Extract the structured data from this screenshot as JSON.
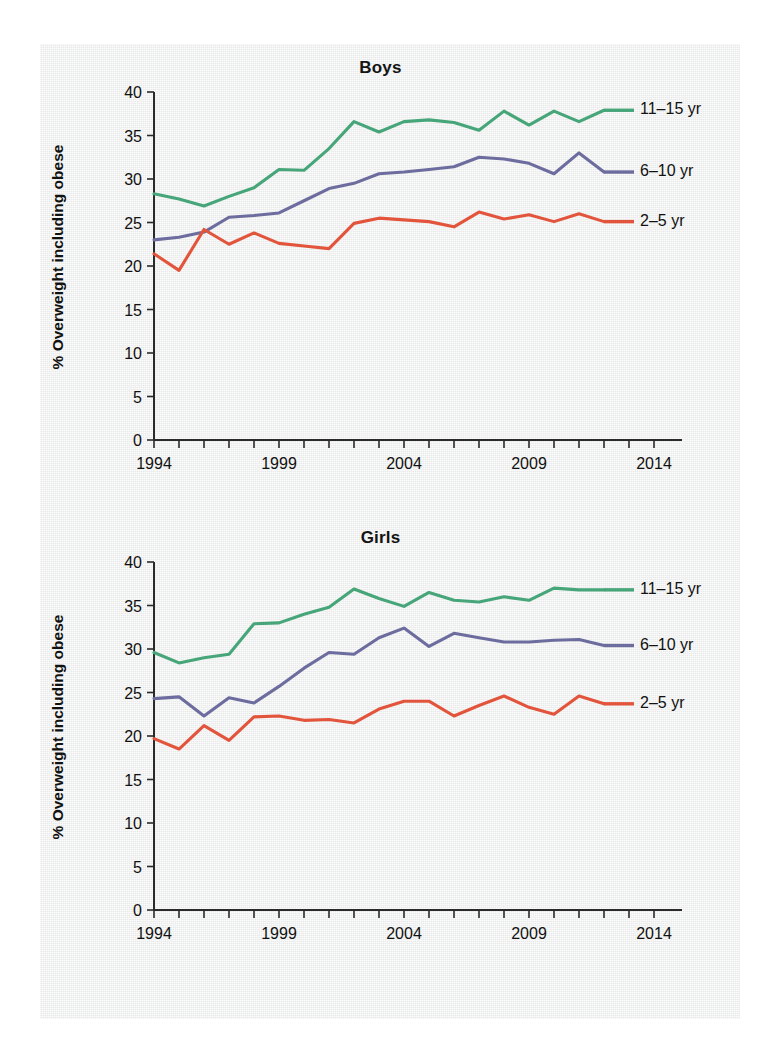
{
  "page": {
    "background_color": "#eef0ef",
    "paper_color": "#ffffff"
  },
  "axis": {
    "ylabel": "% Overweight including obese",
    "yticks": [
      0,
      5,
      10,
      15,
      20,
      25,
      30,
      35,
      40
    ],
    "xticks_labeled": [
      1994,
      1999,
      2004,
      2009,
      2014
    ],
    "xlim": [
      1994,
      2014
    ],
    "ylim": [
      0,
      40
    ]
  },
  "colors": {
    "green": "#46a579",
    "purple": "#6d6c9e",
    "red": "#e2553c",
    "axis": "#2a2a2a",
    "text": "#111111"
  },
  "legend": {
    "entries": [
      {
        "label": "11–15 yr",
        "color": "#46a579"
      },
      {
        "label": "6–10 yr",
        "color": "#6d6c9e"
      },
      {
        "label": "2–5 yr",
        "color": "#e2553c"
      }
    ]
  },
  "chart_data": [
    {
      "type": "line",
      "title": "Boys",
      "xlabel": "",
      "ylabel": "% Overweight including obese",
      "xlim": [
        1994,
        2014
      ],
      "ylim": [
        0,
        40
      ],
      "grid": false,
      "legend_position": "right",
      "x": [
        1994,
        1995,
        1996,
        1997,
        1998,
        1999,
        2000,
        2001,
        2002,
        2003,
        2004,
        2005,
        2006,
        2007,
        2008,
        2009,
        2010,
        2011,
        2012
      ],
      "series": [
        {
          "name": "11–15 yr",
          "color": "#46a579",
          "values": [
            28.3,
            27.7,
            26.9,
            28.0,
            29.0,
            31.1,
            31.0,
            33.5,
            36.6,
            35.4,
            36.6,
            36.8,
            36.5,
            35.6,
            37.8,
            36.2,
            37.8,
            36.6,
            37.9
          ]
        },
        {
          "name": "6–10 yr",
          "color": "#6d6c9e",
          "values": [
            23.0,
            23.3,
            23.9,
            25.6,
            25.8,
            26.1,
            27.5,
            28.9,
            29.5,
            30.6,
            30.8,
            31.1,
            31.4,
            32.5,
            32.3,
            31.8,
            30.6,
            33.0,
            30.8
          ]
        },
        {
          "name": "2–5 yr",
          "color": "#e2553c",
          "values": [
            21.4,
            19.5,
            24.2,
            22.5,
            23.8,
            22.6,
            22.3,
            22.0,
            24.9,
            25.5,
            25.3,
            25.1,
            24.5,
            26.2,
            25.4,
            25.9,
            25.1,
            26.0,
            25.1
          ]
        }
      ]
    },
    {
      "type": "line",
      "title": "Girls",
      "xlabel": "",
      "ylabel": "% Overweight including obese",
      "xlim": [
        1994,
        2014
      ],
      "ylim": [
        0,
        40
      ],
      "grid": false,
      "legend_position": "right",
      "x": [
        1994,
        1995,
        1996,
        1997,
        1998,
        1999,
        2000,
        2001,
        2002,
        2003,
        2004,
        2005,
        2006,
        2007,
        2008,
        2009,
        2010,
        2011,
        2012
      ],
      "series": [
        {
          "name": "11–15 yr",
          "color": "#46a579",
          "values": [
            29.6,
            28.4,
            29.0,
            29.4,
            32.9,
            33.0,
            34.0,
            34.8,
            36.9,
            35.8,
            34.9,
            36.5,
            35.6,
            35.4,
            36.0,
            35.6,
            37.0,
            36.8,
            36.8
          ]
        },
        {
          "name": "6–10 yr",
          "color": "#6d6c9e",
          "values": [
            24.3,
            24.5,
            22.3,
            24.4,
            23.8,
            25.7,
            27.8,
            29.6,
            29.4,
            31.3,
            32.4,
            30.3,
            31.8,
            31.3,
            30.8,
            30.8,
            31.0,
            31.1,
            30.4
          ]
        },
        {
          "name": "2–5 yr",
          "color": "#e2553c",
          "values": [
            19.7,
            18.5,
            21.2,
            19.5,
            22.2,
            22.3,
            21.8,
            21.9,
            21.5,
            23.1,
            24.0,
            24.0,
            22.3,
            23.5,
            24.6,
            23.3,
            22.5,
            24.6,
            23.7
          ]
        }
      ]
    }
  ]
}
